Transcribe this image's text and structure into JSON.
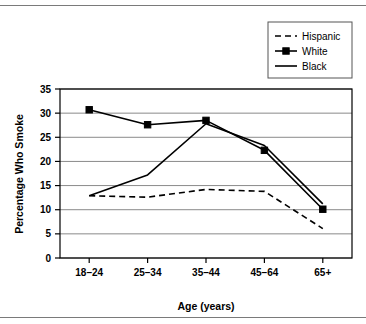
{
  "chart_data": {
    "type": "line",
    "title": "",
    "xlabel": "Age (years)",
    "ylabel": "Percentage Who Smoke",
    "categories": [
      "18–24",
      "25–34",
      "35–44",
      "45–64",
      "65+"
    ],
    "ylim": [
      0,
      35
    ],
    "yticks": [
      0,
      5,
      10,
      15,
      20,
      25,
      30,
      35
    ],
    "ytick_labels": [
      "0",
      "5",
      "10",
      "15",
      "20",
      "25",
      "30",
      "35"
    ],
    "grid": "horizontal",
    "legend_position": "top-right",
    "series": [
      {
        "name": "Hispanic",
        "values": [
          12.9,
          12.6,
          14.2,
          13.8,
          6.1
        ],
        "style": "dashed",
        "marker": "none",
        "color": "#000000"
      },
      {
        "name": "White",
        "values": [
          30.7,
          27.6,
          28.5,
          22.3,
          10.1
        ],
        "style": "solid",
        "marker": "square",
        "color": "#000000"
      },
      {
        "name": "Black",
        "values": [
          12.9,
          17.2,
          27.8,
          23.3,
          11.2
        ],
        "style": "solid",
        "marker": "none",
        "color": "#000000"
      }
    ]
  },
  "legend": {
    "entries": [
      {
        "label": "Hispanic"
      },
      {
        "label": "White"
      },
      {
        "label": "Black"
      }
    ]
  }
}
